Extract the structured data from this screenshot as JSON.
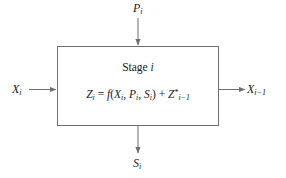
{
  "diagram": {
    "type": "block-diagram",
    "block": {
      "name": "stage-block",
      "label_prefix": "Stage",
      "label_index": "i",
      "equation": {
        "lhs_symbol": "Z",
        "lhs_subscript": "i",
        "equals": "=",
        "function_symbol": "f",
        "open_paren": "(",
        "args": [
          {
            "symbol": "X",
            "subscript": "i"
          },
          {
            "symbol": "P",
            "subscript": "i"
          },
          {
            "symbol": "S",
            "subscript": "i"
          }
        ],
        "arg_separator": ", ",
        "close_paren": ")",
        "plus": "+",
        "term_symbol": "Z",
        "term_superscript": "*",
        "term_subscript": "i−1",
        "plain_text": "Z_i = f(X_i, P_i, S_i) + Z*_{i-1}"
      },
      "geometry": {
        "x": 57,
        "y": 46,
        "width": 162,
        "height": 80
      },
      "fill": "#ffffff",
      "stroke": "#6e6e6e"
    },
    "arrows": [
      {
        "name": "input-arrow-p",
        "direction": "down",
        "label_symbol": "P",
        "label_subscript": "i",
        "label_text": "P_i",
        "from": {
          "x": 138,
          "y": 18
        },
        "to": {
          "x": 138,
          "y": 46
        }
      },
      {
        "name": "input-arrow-x",
        "direction": "right",
        "label_symbol": "X",
        "label_subscript": "i",
        "label_text": "X_i",
        "from": {
          "x": 30,
          "y": 89
        },
        "to": {
          "x": 57,
          "y": 89
        }
      },
      {
        "name": "output-arrow-x-prev",
        "direction": "right",
        "label_symbol": "X",
        "label_subscript": "i−1",
        "label_text": "X_i-1",
        "from": {
          "x": 219,
          "y": 89
        },
        "to": {
          "x": 245,
          "y": 89
        }
      },
      {
        "name": "output-arrow-s",
        "direction": "down",
        "label_symbol": "S",
        "label_subscript": "i",
        "label_text": "S_i",
        "from": {
          "x": 138,
          "y": 126
        },
        "to": {
          "x": 138,
          "y": 153
        }
      }
    ],
    "colors": {
      "background": "#ffffff",
      "line": "#6e6e6e",
      "text": "#1a1a1a"
    }
  }
}
